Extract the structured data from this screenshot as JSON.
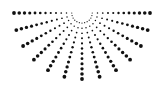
{
  "graphic": {
    "name": "half-sunburst-dot-pattern",
    "background": "#ffffff",
    "dot_color": "#111111",
    "center": [
      82,
      13
    ],
    "radius_x": 68,
    "radius_y": 66,
    "ray_count": 13,
    "angle_step_deg": 15,
    "dots_per_ray": 12,
    "inner_radius": 5,
    "min_dot_r": 0.5,
    "max_dot_r": 1.9
  }
}
